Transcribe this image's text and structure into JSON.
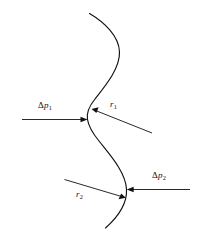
{
  "figure": {
    "background_color": "#ffffff",
    "line_color": "#111111",
    "width": 197,
    "height": 241,
    "labels": {
      "delta_p1": {
        "symbol": "Δ",
        "variable": "p",
        "subscript": "1",
        "text": "Δp1"
      },
      "r1": {
        "variable": "r",
        "subscript": "1",
        "text": "r1"
      },
      "r2": {
        "variable": "r",
        "subscript": "2",
        "text": "r2"
      },
      "delta_p2": {
        "symbol": "Δ",
        "variable": "p",
        "subscript": "2",
        "text": "Δp2"
      }
    },
    "elements": {
      "curve_name": "s-shaped-interface-curve",
      "arrow_dp1_direction": "right",
      "arrow_dp2_direction": "left",
      "leader_r1_direction": "up-left",
      "leader_r2_direction": "down-right"
    }
  }
}
